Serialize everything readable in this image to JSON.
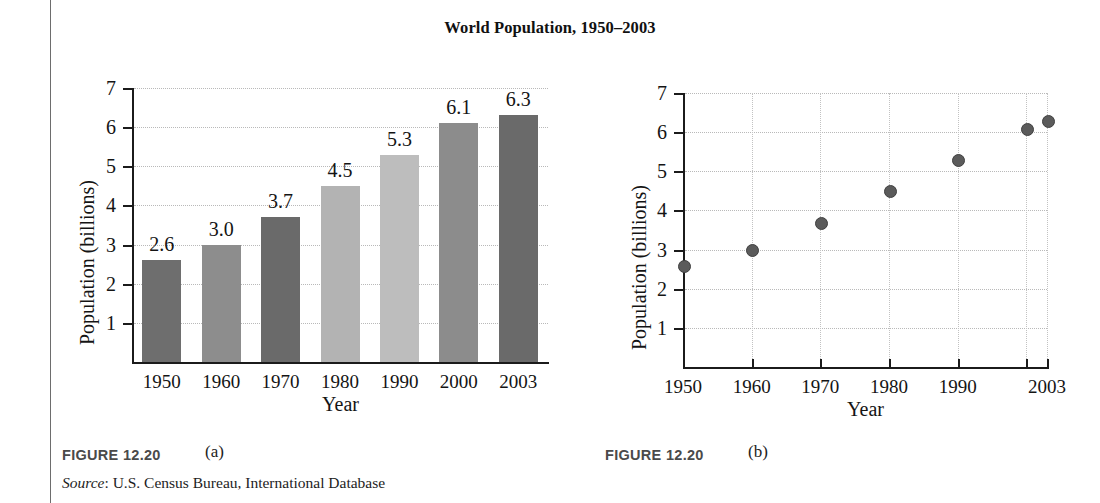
{
  "page": {
    "title": "World Population, 1950–2003",
    "rule_color": "#6d6d6d"
  },
  "figure_a": {
    "caption_label": "FIGURE 12.20",
    "caption_part": "(a)",
    "source_prefix": "Source",
    "source_text": ": U.S. Census Bureau, International Database"
  },
  "figure_b": {
    "caption_label": "FIGURE 12.20",
    "caption_part": "(b)"
  },
  "chart_data": [
    {
      "type": "bar",
      "title": "World Population, 1950–2003",
      "xlabel": "Year",
      "ylabel": "Population (billions)",
      "categories": [
        "1950",
        "1960",
        "1970",
        "1980",
        "1990",
        "2000",
        "2003"
      ],
      "values": [
        2.6,
        3.0,
        3.7,
        4.5,
        5.3,
        6.1,
        6.3
      ],
      "data_labels": [
        "2.6",
        "3.0",
        "3.7",
        "4.5",
        "5.3",
        "6.1",
        "6.3"
      ],
      "bar_colors": [
        "#6e6e6e",
        "#8d8d8d",
        "#6a6a6a",
        "#b3b3b3",
        "#bdbdbd",
        "#8c8c8c",
        "#6a6a6a"
      ],
      "ylim": [
        0,
        7
      ],
      "yticks": [
        "1",
        "2",
        "3",
        "4",
        "5",
        "6",
        "7"
      ],
      "ytick_values": [
        1,
        2,
        3,
        4,
        5,
        6,
        7
      ],
      "grid": "horizontal-dotted",
      "legend": "none"
    },
    {
      "type": "scatter",
      "title": "World Population, 1950–2003",
      "xlabel": "Year",
      "ylabel": "Population (billions)",
      "x": [
        1950,
        1960,
        1970,
        1980,
        1990,
        2000,
        2003
      ],
      "y": [
        2.6,
        3.0,
        3.7,
        4.5,
        5.3,
        6.1,
        6.3
      ],
      "xtick_labels": [
        "1950",
        "1960",
        "1970",
        "1980",
        "1990",
        "2003"
      ],
      "xtick_values": [
        1950,
        1960,
        1970,
        1980,
        1990,
        2003
      ],
      "ylim": [
        0,
        7
      ],
      "xlim": [
        1950,
        2003
      ],
      "yticks": [
        "1",
        "2",
        "3",
        "4",
        "5",
        "6",
        "7"
      ],
      "ytick_values": [
        1,
        2,
        3,
        4,
        5,
        6,
        7
      ],
      "marker_color": "#5b5b5b",
      "grid": "both-dotted",
      "legend": "none"
    }
  ]
}
